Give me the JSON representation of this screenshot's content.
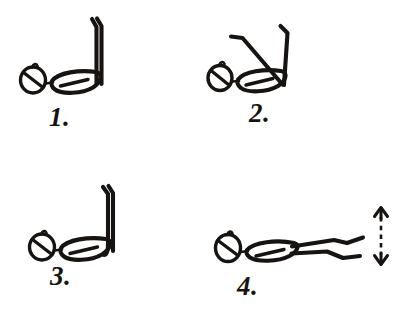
{
  "document": {
    "kind": "hand-drawn-sketch",
    "title": "Lying leg exercise — four steps",
    "background_color": "#ffffff",
    "ink_color": "#161310",
    "panel_count": 4
  },
  "panels": [
    {
      "id": "step-1",
      "label": "1.",
      "number": "1",
      "pose": "Lying on back, both legs raised straight up vertically",
      "figure": {
        "head": "circle-with-diagonal-slash",
        "body": "horizontal-ellipse-with-inner-line",
        "legs": "two-parallel-vertical-legs-up",
        "leg_angle_degrees": 90
      },
      "arrow": null
    },
    {
      "id": "step-2",
      "label": "2.",
      "number": "2",
      "pose": "Lying on back, legs spread apart in a V shape",
      "figure": {
        "head": "circle-with-diagonal-slash",
        "body": "horizontal-ellipse-with-inner-line",
        "legs": "two-legs-splayed-in-v-shape",
        "leg_angle_degrees": 60
      },
      "arrow": null
    },
    {
      "id": "step-3",
      "label": "3.",
      "number": "3",
      "pose": "Lying on back, legs brought back together straight up",
      "figure": {
        "head": "circle-with-diagonal-slash",
        "body": "horizontal-ellipse-with-inner-line",
        "legs": "two-parallel-vertical-legs-up",
        "leg_angle_degrees": 90
      },
      "arrow": null
    },
    {
      "id": "step-4",
      "label": "4.",
      "number": "4",
      "pose": "Lying on back, legs lowered down to horizontal",
      "figure": {
        "head": "circle-with-diagonal-slash",
        "body": "horizontal-ellipse-with-inner-line",
        "legs": "two-legs-extended-horizontally",
        "leg_angle_degrees": 0
      },
      "arrow": {
        "type": "double-headed-vertical-arrow",
        "style": "dashed-shaft",
        "meaning": "raise and lower legs"
      }
    }
  ]
}
